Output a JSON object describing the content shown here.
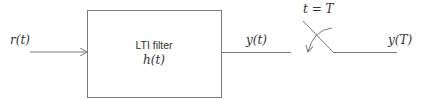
{
  "diagram": {
    "input": {
      "label": "r(t)"
    },
    "block": {
      "title": "LTI filter",
      "subtitle": "h(t)"
    },
    "output": {
      "label": "y(t)"
    },
    "switch": {
      "label": "t = T"
    },
    "sampled_output": {
      "label": "y(T)"
    }
  },
  "colors": {
    "line": "#7a7a7a",
    "text": "#333333",
    "background": "#ffffff"
  }
}
